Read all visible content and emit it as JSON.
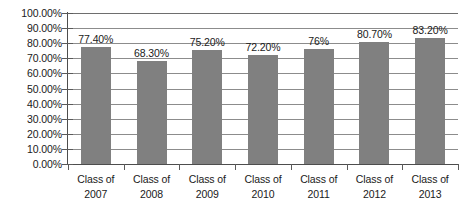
{
  "chart_data": {
    "type": "bar",
    "title": "",
    "subtitle": "",
    "xlabel": "",
    "ylabel": "",
    "categories": [
      "Class of 2007",
      "Class of 2008",
      "Class of 2009",
      "Class of 2010",
      "Class of 2011",
      "Class of 2012",
      "Class of 2013"
    ],
    "category_lines": [
      [
        "Class of",
        "2007"
      ],
      [
        "Class of",
        "2008"
      ],
      [
        "Class of",
        "2009"
      ],
      [
        "Class of",
        "2010"
      ],
      [
        "Class of",
        "2011"
      ],
      [
        "Class of",
        "2012"
      ],
      [
        "Class of",
        "2013"
      ]
    ],
    "values": [
      77.4,
      68.3,
      75.2,
      72.2,
      76.0,
      80.7,
      83.2
    ],
    "data_labels": [
      "77.40%",
      "68.30%",
      "75.20%",
      "72.20%",
      "76%",
      "80.70%",
      "83.20%"
    ],
    "ylim": [
      0,
      100
    ],
    "ytick_values": [
      0,
      10,
      20,
      30,
      40,
      50,
      60,
      70,
      80,
      90,
      100
    ],
    "ytick_labels": [
      "0.00%",
      "10.00%",
      "20.00%",
      "30.00%",
      "40.00%",
      "50.00%",
      "60.00%",
      "70.00%",
      "80.00%",
      "90.00%",
      "100.00%"
    ],
    "grid": true,
    "grid_axis": "y",
    "legend": false,
    "legend_position": "none",
    "series": [
      {
        "name": "Graduation Rate",
        "color": "#808080",
        "values": [
          77.4,
          68.3,
          75.2,
          72.2,
          76.0,
          80.7,
          83.2
        ]
      }
    ],
    "colors": {
      "bar": "#808080",
      "gridline": "#8c8c8c",
      "axis": "#4d4d4d",
      "text": "#1a1a1a",
      "background": "#ffffff"
    }
  }
}
